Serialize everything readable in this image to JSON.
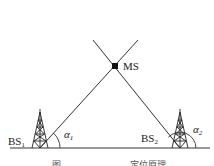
{
  "diagram": {
    "type": "AOA positioning geometry",
    "mobile_station": {
      "label": "MS",
      "x": 115,
      "y": 66
    },
    "base_stations": [
      {
        "label": "BS",
        "subscript": "1",
        "x": 40,
        "y": 148,
        "angle_label": "α",
        "angle_subscript": "1"
      },
      {
        "label": "BS",
        "subscript": "2",
        "x": 180,
        "y": 148,
        "angle_label": "α",
        "angle_subscript": "2"
      }
    ],
    "lines": [
      {
        "from": "BS1",
        "through": "MS",
        "extends_to": [
          93,
          40
        ]
      },
      {
        "from": "BS2",
        "through": "MS",
        "extends_to": [
          138,
          40
        ]
      }
    ],
    "ground": {
      "y": 148,
      "x_start": 10,
      "x_end": 210
    },
    "caption": {
      "prefix": "图",
      "suffix": "定位原理"
    },
    "colors": {
      "line": "#333333",
      "node": "#111111",
      "background": "#ffffff"
    }
  }
}
